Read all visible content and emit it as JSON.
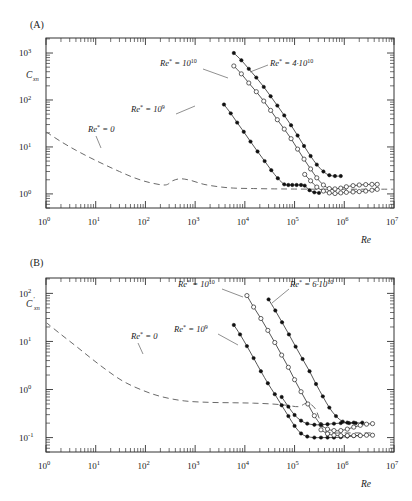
{
  "figure": {
    "width": 412,
    "height": 501,
    "background": "#ffffff",
    "ink_color": "#1a1a1a"
  },
  "panels": [
    {
      "id": "A",
      "panel_label": "(A)",
      "ylabel": "C",
      "ylabel_sub": "xn",
      "ylabel_prime": "",
      "xlabel": "Re"
    },
    {
      "id": "B",
      "panel_label": "(B)",
      "ylabel": "C",
      "ylabel_sub": "xn",
      "ylabel_prime": "′",
      "xlabel": "Re"
    }
  ],
  "axis_text": {
    "x_ticks": [
      "10",
      "10",
      "10",
      "10",
      "10",
      "10",
      "10",
      "10"
    ],
    "x_exponents": [
      "0",
      "1",
      "2",
      "3",
      "4",
      "5",
      "6",
      "7"
    ],
    "panelA_y_ticks": [
      "10",
      "10",
      "10",
      "10"
    ],
    "panelA_y_exponents": [
      "0",
      "1",
      "2",
      "3"
    ],
    "panelB_y_ticks": [
      "10",
      "10",
      "10",
      "10"
    ],
    "panelB_y_exponents": [
      "-1",
      "0",
      "1",
      "2"
    ]
  },
  "annotations": {
    "panelA": [
      {
        "name": "re-star-0",
        "base": "Re",
        "star": "*",
        "eq": " = 0",
        "mant": "",
        "exp": ""
      },
      {
        "name": "re-star-1e9",
        "base": "Re",
        "star": "*",
        "eq": " = 10",
        "mant": "",
        "exp": "9"
      },
      {
        "name": "re-star-1e10",
        "base": "Re",
        "star": "*",
        "eq": " = 10",
        "mant": "",
        "exp": "10"
      },
      {
        "name": "re-star-4e10",
        "base": "Re",
        "star": "*",
        "eq": " = 4·10",
        "mant": "",
        "exp": "10"
      }
    ],
    "panelB": [
      {
        "name": "re-star-0",
        "base": "Re",
        "star": "*",
        "eq": " = 0",
        "mant": "",
        "exp": ""
      },
      {
        "name": "re-star-1e9",
        "base": "Re",
        "star": "*",
        "eq": " = 10",
        "mant": "",
        "exp": "9"
      },
      {
        "name": "re-star-1e10",
        "base": "Re",
        "star": "*",
        "eq": " = 10",
        "mant": "",
        "exp": "10"
      },
      {
        "name": "re-star-6e10",
        "base": "Re",
        "star": "*",
        "eq": " = 6·10",
        "mant": "",
        "exp": "10"
      }
    ]
  },
  "chart_data": [
    {
      "type": "line",
      "panel": "A",
      "title": "(A)",
      "xlabel": "Re",
      "ylabel": "C_xn",
      "xscale": "log",
      "yscale": "log",
      "xlim": [
        1,
        10000000
      ],
      "ylim": [
        0.3,
        3000
      ],
      "xticks": [
        1,
        10,
        100,
        1000,
        10000,
        100000,
        1000000,
        10000000
      ],
      "yticks": [
        1,
        10,
        100,
        1000
      ],
      "grid": false,
      "legend": "inline-annotations",
      "series": [
        {
          "name": "Re* = 0",
          "style": "dashed",
          "marker": "none",
          "x": [
            1,
            2,
            4,
            8,
            15,
            30,
            60,
            120,
            250,
            350,
            500,
            800,
            1500,
            3000,
            6000,
            15000,
            40000,
            100000,
            300000,
            1000000,
            4000000,
            10000000
          ],
          "y": [
            21.0,
            13.0,
            8.5,
            5.8,
            4.2,
            3.0,
            2.2,
            1.75,
            1.55,
            1.9,
            2.1,
            1.95,
            1.6,
            1.42,
            1.33,
            1.3,
            1.28,
            1.27,
            1.26,
            1.26,
            1.26,
            1.26
          ]
        },
        {
          "name": "Re* = 10^9",
          "style": "solid",
          "marker": "filled-circle",
          "x": [
            3800,
            5200,
            7000,
            9500,
            13000,
            18000,
            25000,
            34000,
            46000,
            62000,
            75000,
            90000,
            110000,
            135000,
            160000,
            200000,
            250000,
            310000
          ],
          "y": [
            80,
            52,
            33,
            21,
            13.0,
            8.0,
            5.0,
            3.2,
            2.15,
            1.6,
            1.55,
            1.55,
            1.55,
            1.55,
            1.5,
            1.2,
            1.08,
            1.05
          ]
        },
        {
          "name": "Re* = 10^10",
          "style": "solid",
          "marker": "open-circle",
          "x": [
            6000,
            8500,
            12000,
            17000,
            24000,
            33000,
            45000,
            62000,
            85000,
            115000,
            155000,
            210000,
            280000,
            380000,
            500000,
            650000,
            850000,
            1100000,
            1500000,
            2000000,
            2700000,
            3600000,
            4600000
          ],
          "y": [
            530,
            360,
            230,
            150,
            95,
            60,
            38,
            24,
            15.0,
            9.0,
            5.5,
            3.4,
            2.2,
            1.55,
            1.3,
            1.28,
            1.33,
            1.42,
            1.5,
            1.55,
            1.58,
            1.6,
            1.6
          ]
        },
        {
          "name": "Re* = 4·10^10",
          "style": "solid",
          "marker": "filled-circle",
          "x": [
            6000,
            8500,
            12000,
            17000,
            24000,
            33000,
            45000,
            62000,
            85000,
            115000,
            155000,
            210000,
            280000,
            380000,
            500000,
            650000,
            850000
          ],
          "y": [
            1000,
            700,
            460,
            300,
            190,
            120,
            76,
            47,
            29,
            17.5,
            10.5,
            6.4,
            4.2,
            3.0,
            2.5,
            2.4,
            2.4
          ]
        },
        {
          "name": "Re* = 10^10 lower branch",
          "style": "solid",
          "marker": "open-circle",
          "x": [
            160000,
            210000,
            280000,
            380000,
            500000,
            650000,
            850000,
            1100000,
            1500000,
            2000000,
            2700000,
            3600000,
            4600000
          ],
          "y": [
            2.6,
            1.9,
            1.4,
            1.15,
            1.05,
            1.02,
            1.05,
            1.08,
            1.1,
            1.12,
            1.15,
            1.2,
            1.25
          ]
        }
      ]
    },
    {
      "type": "line",
      "panel": "B",
      "title": "(B)",
      "xlabel": "Re",
      "ylabel": "C'_xn",
      "xscale": "log",
      "yscale": "log",
      "xlim": [
        1,
        10000000
      ],
      "ylim": [
        0.03,
        300
      ],
      "xticks": [
        1,
        10,
        100,
        1000,
        10000,
        100000,
        1000000,
        10000000
      ],
      "yticks": [
        0.1,
        1,
        10,
        100
      ],
      "grid": false,
      "legend": "inline-annotations",
      "series": [
        {
          "name": "Re* = 0",
          "style": "dashed",
          "marker": "none",
          "x": [
            1,
            2,
            4,
            8,
            16,
            35,
            80,
            200,
            600,
            2000,
            6000,
            15000,
            35000,
            70000,
            120000,
            180000,
            260000,
            340000,
            420000,
            600000,
            1000000,
            2000000,
            4000000
          ],
          "y": [
            25.0,
            14.0,
            8.0,
            4.5,
            2.6,
            1.5,
            1.0,
            0.72,
            0.58,
            0.54,
            0.53,
            0.52,
            0.5,
            0.47,
            0.44,
            0.52,
            0.4,
            0.2,
            0.135,
            0.125,
            0.125,
            0.125,
            0.125
          ]
        },
        {
          "name": "Re* = 10^9",
          "style": "solid",
          "marker": "filled-circle",
          "x": [
            6000,
            8000,
            11000,
            15000,
            21000,
            29000,
            40000,
            55000,
            75000,
            100000,
            135000,
            180000,
            250000,
            340000,
            460000,
            620000,
            850000,
            1150000,
            1550000,
            2100000
          ],
          "y": [
            22.0,
            14.0,
            8.0,
            4.5,
            2.4,
            1.35,
            0.8,
            0.47,
            0.28,
            0.175,
            0.122,
            0.105,
            0.1,
            0.1,
            0.1,
            0.1,
            0.102,
            0.105,
            0.108,
            0.11
          ]
        },
        {
          "name": "Re* = 10^10",
          "style": "solid",
          "marker": "open-circle",
          "x": [
            11000,
            15000,
            21000,
            29000,
            40000,
            55000,
            75000,
            100000,
            135000,
            185000,
            250000,
            340000,
            460000,
            620000,
            850000,
            1150000,
            1550000,
            2100000,
            2800000,
            3700000
          ],
          "y": [
            90,
            52,
            30,
            17.0,
            9.5,
            5.2,
            2.9,
            1.6,
            0.9,
            0.5,
            0.285,
            0.185,
            0.15,
            0.14,
            0.14,
            0.15,
            0.165,
            0.18,
            0.19,
            0.195
          ]
        },
        {
          "name": "Re* = 6·10^10",
          "style": "solid",
          "marker": "filled-circle",
          "x": [
            30000,
            41000,
            56000,
            77000,
            105000,
            145000,
            200000,
            270000,
            370000,
            500000,
            680000,
            930000,
            1250000,
            1700000,
            2300000
          ],
          "y": [
            75,
            44,
            25,
            14.0,
            7.8,
            4.3,
            2.4,
            1.3,
            0.72,
            0.42,
            0.28,
            0.215,
            0.2,
            0.2,
            0.205
          ]
        },
        {
          "name": "Re* = 10^9 upper branch",
          "style": "solid",
          "marker": "filled-circle",
          "x": [
            55000,
            75000,
            100000,
            135000,
            180000,
            250000,
            340000,
            460000,
            620000,
            850000,
            1150000,
            1550000
          ],
          "y": [
            0.7,
            0.44,
            0.295,
            0.225,
            0.195,
            0.185,
            0.185,
            0.19,
            0.195,
            0.2,
            0.205,
            0.205
          ]
        },
        {
          "name": "Re* = 10^10 lower branch",
          "style": "solid",
          "marker": "open-circle",
          "x": [
            340000,
            460000,
            620000,
            850000,
            1150000,
            1550000,
            2100000,
            2800000,
            3700000
          ],
          "y": [
            0.145,
            0.12,
            0.112,
            0.11,
            0.11,
            0.11,
            0.11,
            0.112,
            0.112
          ]
        }
      ]
    }
  ]
}
